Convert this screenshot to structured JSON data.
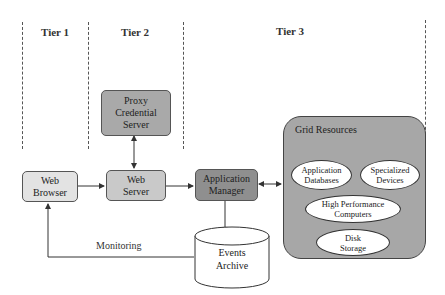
{
  "tiers": [
    {
      "label": "Tier 1"
    },
    {
      "label": "Tier 2"
    },
    {
      "label": "Tier 3"
    }
  ],
  "nodes": {
    "proxy_credential_server": {
      "label": "Proxy Credential Server",
      "lines": [
        "Proxy",
        "Credential",
        "Server"
      ],
      "fill": "#a9a9a9"
    },
    "web_browser": {
      "label": "Web Browser",
      "lines": [
        "Web",
        "Browser"
      ],
      "fill": "#e3e3e3"
    },
    "web_server": {
      "label": "Web Server",
      "lines": [
        "Web",
        "Server"
      ],
      "fill": "#c9c9c9"
    },
    "application_manager": {
      "label": "Application Manager",
      "lines": [
        "Application",
        "Manager"
      ],
      "fill": "#8f8f8f"
    },
    "events_archive": {
      "label": "Events Archive",
      "lines": [
        "Events",
        "Archive"
      ],
      "fill": "#ffffff"
    }
  },
  "grid_resources": {
    "title": "Grid Resources",
    "fill": "#a7a7a7",
    "items": [
      {
        "lines": [
          "Application",
          "Databases"
        ]
      },
      {
        "lines": [
          "Specialized",
          "Devices"
        ]
      },
      {
        "lines": [
          "High Performance",
          "Computers"
        ]
      },
      {
        "lines": [
          "Disk",
          "Storage"
        ]
      }
    ]
  },
  "edges": [
    {
      "from": "proxy_credential_server",
      "to": "web_server",
      "type": "bidirectional"
    },
    {
      "from": "web_browser",
      "to": "web_server",
      "type": "directed"
    },
    {
      "from": "web_server",
      "to": "application_manager",
      "type": "directed"
    },
    {
      "from": "application_manager",
      "to": "grid_resources",
      "type": "bidirectional"
    },
    {
      "from": "application_manager",
      "to": "events_archive",
      "type": "directed"
    },
    {
      "from": "events_archive",
      "to": "web_browser",
      "type": "directed",
      "label": "Monitoring"
    }
  ],
  "monitoring_label": "Monitoring"
}
